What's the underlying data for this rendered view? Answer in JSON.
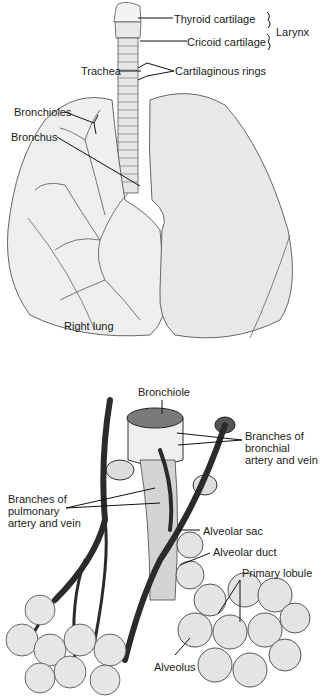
{
  "top_figure": {
    "labels": {
      "thyroid_cartilage": "Thyroid cartilage",
      "cricoid_cartilage": "Cricoid cartilage",
      "larynx": "Larynx",
      "trachea": "Trachea",
      "cartilaginous_rings": "Cartilaginous rings",
      "bronchioles": "Bronchioles",
      "bronchus": "Bronchus",
      "right_lung": "Right lung"
    }
  },
  "bottom_figure": {
    "labels": {
      "bronchiole": "Bronchiole",
      "branches_bronchial": [
        "Branches of",
        "bronchial",
        "artery and vein"
      ],
      "branches_pulmonary": [
        "Branches of",
        "pulmonary",
        "artery and vein"
      ],
      "alveolar_sac": "Alveolar sac",
      "alveolar_duct": "Alveolar duct",
      "primary_lobule": "Primary lobule",
      "alveolus": "Alveolus"
    }
  },
  "colors": {
    "ink": "#1a1a1a",
    "lung_fill": "#ececec",
    "vessel": "#2b2b2b",
    "alveolus_fill": "#e4e4e4"
  }
}
